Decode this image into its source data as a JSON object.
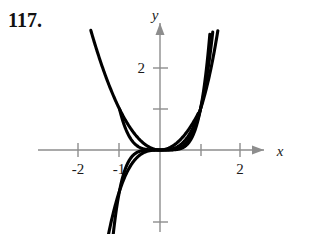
{
  "exercise": {
    "number": "117."
  },
  "figure": {
    "axis_labels": {
      "x": "x",
      "y": "y"
    },
    "x_tick_labels": [
      "-2",
      "-1",
      "2"
    ],
    "y_tick_labels": [
      "2"
    ],
    "colors": {
      "curve": "#000000",
      "axis": "#8d8d8d",
      "text": "#1a1a1a",
      "background": "#ffffff"
    }
  },
  "chart_data": {
    "type": "line",
    "title": "",
    "xlabel": "x",
    "ylabel": "y",
    "xlim": [
      -2.5,
      2.6
    ],
    "ylim": [
      -2.1,
      3.2
    ],
    "grid": false,
    "legend": "none",
    "xticks": [
      -2,
      -1,
      2
    ],
    "xticklabels": [
      "-2",
      "-1",
      "2"
    ],
    "yticks": [
      1,
      2,
      -1.8
    ],
    "yticklabels": [
      "",
      "2",
      ""
    ],
    "annotations": [],
    "series": [
      {
        "name": "y = x^2",
        "kind": "even-power",
        "x": [
          -1.75,
          -1.5,
          -1.25,
          -1.0,
          -0.75,
          -0.5,
          -0.25,
          0,
          0.25,
          0.5,
          0.75,
          0.95
        ],
        "values": [
          3.06,
          2.25,
          1.56,
          1.0,
          0.56,
          0.25,
          0.06,
          0,
          0.06,
          0.25,
          0.56,
          0.9
        ]
      },
      {
        "name": "y = x^4",
        "kind": "even-power",
        "x": [
          -1.0,
          -0.8,
          -0.6,
          -0.4,
          -0.2,
          0,
          0.2,
          0.4,
          0.6,
          0.8,
          1.0,
          1.2,
          1.32
        ],
        "values": [
          1.0,
          0.41,
          0.13,
          0.026,
          0.0016,
          0,
          0.0016,
          0.026,
          0.13,
          0.41,
          1.0,
          2.07,
          3.04
        ]
      },
      {
        "name": "y = x^3",
        "kind": "odd-power",
        "x": [
          -1.45,
          -1.25,
          -1.0,
          -0.75,
          -0.5,
          -0.25,
          0,
          0.25,
          0.5,
          0.75,
          1.0,
          1.25,
          1.45
        ],
        "values": [
          -3.05,
          -1.95,
          -1.0,
          -0.42,
          -0.125,
          -0.016,
          0,
          0.016,
          0.125,
          0.42,
          1.0,
          1.95,
          3.05
        ]
      },
      {
        "name": "y = x^5",
        "kind": "odd-power",
        "x": [
          -1.25,
          -1.1,
          -1.0,
          -0.85,
          -0.6,
          -0.3,
          0,
          0.3,
          0.6,
          0.85,
          1.0,
          1.1,
          1.25
        ],
        "values": [
          -3.05,
          -1.61,
          -1.0,
          -0.44,
          -0.078,
          -0.0024,
          0,
          0.0024,
          0.078,
          0.44,
          1.0,
          1.61,
          3.05
        ]
      }
    ]
  }
}
